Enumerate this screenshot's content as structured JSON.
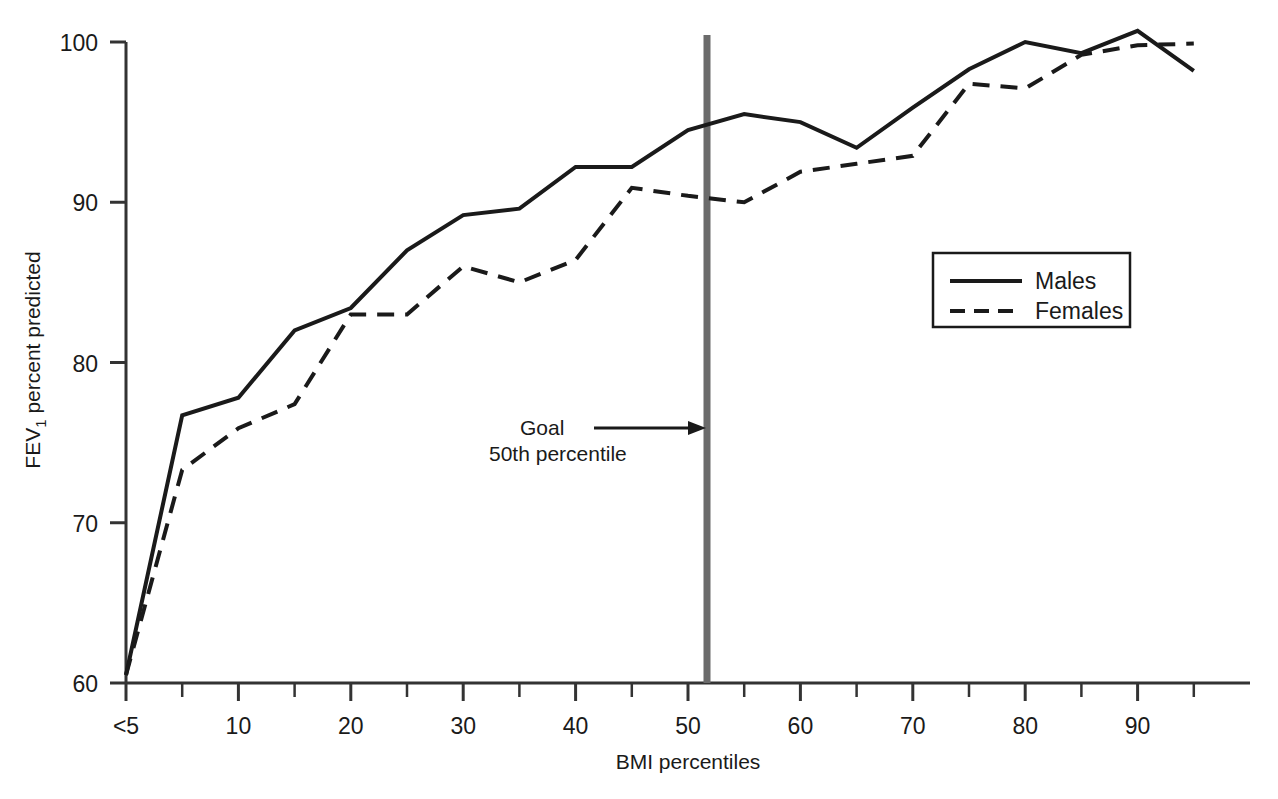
{
  "figure": {
    "background_color": "#ffffff",
    "ink_color": "#1a1a1a",
    "goal_line_color": "#6b6b6b"
  },
  "axes": {
    "x_title": "BMI percentiles",
    "y_title_prefix": "FEV",
    "y_title_subscript": "1",
    "y_title_suffix": " percent predicted",
    "x_tick_labels": [
      "<5",
      "10",
      "20",
      "30",
      "40",
      "50",
      "60",
      "70",
      "80",
      "90"
    ],
    "y_tick_labels": [
      "60",
      "70",
      "80",
      "90",
      "100"
    ]
  },
  "legend": {
    "items": [
      {
        "label": "Males",
        "style": "solid"
      },
      {
        "label": "Females",
        "style": "dashed"
      }
    ]
  },
  "annotation": {
    "line1": "Goal",
    "line2": "50th percentile",
    "target_x": 50
  },
  "chart_data": {
    "type": "line",
    "title": "",
    "xlabel": "BMI percentiles",
    "ylabel": "FEV1 percent predicted",
    "xlim": [
      0,
      100
    ],
    "ylim": [
      60,
      100
    ],
    "grid": false,
    "legend_position": "upper-right",
    "x_tick_values": [
      0,
      10,
      20,
      30,
      40,
      50,
      60,
      70,
      80,
      90
    ],
    "x_minor_tick_values": [
      5,
      15,
      25,
      35,
      45,
      55,
      65,
      75,
      85,
      95
    ],
    "y_tick_values": [
      60,
      70,
      80,
      90,
      100
    ],
    "x": [
      0,
      5,
      10,
      15,
      20,
      25,
      30,
      35,
      40,
      45,
      50,
      55,
      60,
      65,
      70,
      75,
      80,
      85,
      90,
      95
    ],
    "series": [
      {
        "name": "Males",
        "style": "solid",
        "values": [
          60.5,
          76.7,
          77.8,
          82.0,
          83.4,
          87.0,
          89.2,
          89.6,
          92.2,
          92.2,
          94.5,
          95.5,
          95.0,
          93.4,
          95.9,
          98.3,
          100.0,
          99.3,
          100.7,
          98.2
        ]
      },
      {
        "name": "Females",
        "style": "dashed",
        "values": [
          60.5,
          73.3,
          75.9,
          77.4,
          83.0,
          83.0,
          86.0,
          85.0,
          86.4,
          90.9,
          90.4,
          90.0,
          91.9,
          92.4,
          92.9,
          97.4,
          97.1,
          99.2,
          99.8,
          99.9
        ]
      }
    ],
    "annotations": [
      {
        "text": "Goal",
        "x": 50,
        "y": 78,
        "type": "arrow-to-vline"
      },
      {
        "text": "50th percentile",
        "x": 50,
        "y": 76.5,
        "type": "label"
      }
    ],
    "vertical_reference_line": {
      "x": 50,
      "color": "#6b6b6b",
      "label": "Goal 50th percentile"
    }
  }
}
